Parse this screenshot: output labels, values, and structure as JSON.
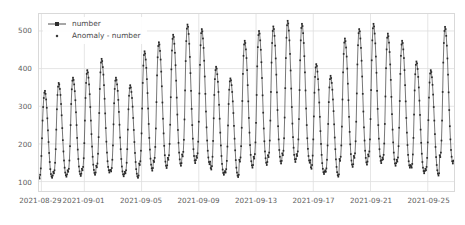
{
  "chart_data": {
    "type": "line",
    "title": "",
    "xlabel": "",
    "ylabel": "",
    "ylim": [
      75,
      545
    ],
    "xlim": [
      0,
      696
    ],
    "grid": true,
    "legend_position": "upper-left",
    "y_ticks": [
      100,
      200,
      300,
      400,
      500
    ],
    "y_tick_labels": [
      "100",
      "200",
      "300",
      "400",
      "500"
    ],
    "x_ticks": [
      4,
      76,
      172,
      268,
      364,
      460,
      556,
      652
    ],
    "x_tick_labels": [
      "2021-08-29",
      "2021-09-01",
      "2021-09-05",
      "2021-09-09",
      "2021-09-13",
      "2021-09-17",
      "2021-09-21",
      "2021-09-25"
    ],
    "series": [
      {
        "name": "number",
        "style": "line-markers",
        "color": "#3a3a3a",
        "marker": "square",
        "values": [
          112,
          108,
          118,
          135,
          168,
          215,
          262,
          298,
          322,
          336,
          341,
          333,
          318,
          296,
          268,
          236,
          205,
          176,
          152,
          133,
          120,
          114,
          110,
          116,
          126,
          122,
          130,
          150,
          186,
          238,
          292,
          330,
          352,
          362,
          358,
          346,
          330,
          306,
          276,
          242,
          210,
          180,
          156,
          137,
          124,
          117,
          113,
          119,
          130,
          126,
          134,
          156,
          194,
          250,
          306,
          345,
          368,
          376,
          370,
          358,
          340,
          316,
          284,
          250,
          216,
          185,
          160,
          140,
          127,
          120,
          115,
          121,
          134,
          130,
          139,
          162,
          202,
          262,
          322,
          362,
          386,
          396,
          390,
          376,
          358,
          332,
          298,
          262,
          226,
          193,
          166,
          145,
          131,
          123,
          118,
          124,
          142,
          138,
          148,
          174,
          218,
          282,
          346,
          390,
          416,
          426,
          420,
          404,
          384,
          356,
          320,
          281,
          242,
          206,
          177,
          154,
          139,
          130,
          124,
          130,
          131,
          127,
          136,
          158,
          196,
          252,
          308,
          346,
          368,
          376,
          370,
          358,
          341,
          317,
          285,
          251,
          217,
          186,
          160,
          140,
          127,
          119,
          114,
          120,
          126,
          122,
          130,
          150,
          186,
          238,
          292,
          328,
          348,
          356,
          350,
          338,
          322,
          299,
          269,
          237,
          205,
          176,
          152,
          133,
          121,
          114,
          110,
          116,
          148,
          144,
          154,
          182,
          228,
          294,
          362,
          408,
          436,
          446,
          440,
          424,
          402,
          372,
          335,
          294,
          253,
          216,
          185,
          161,
          145,
          135,
          129,
          136,
          156,
          152,
          163,
          192,
          241,
          311,
          382,
          430,
          460,
          470,
          464,
          447,
          424,
          392,
          353,
          310,
          267,
          228,
          195,
          170,
          153,
          142,
          136,
          143,
          163,
          158,
          170,
          200,
          251,
          324,
          398,
          448,
          479,
          490,
          484,
          466,
          442,
          409,
          368,
          323,
          278,
          237,
          203,
          177,
          159,
          148,
          142,
          149,
          172,
          167,
          179,
          211,
          265,
          342,
          420,
          473,
          506,
          517,
          511,
          492,
          466,
          431,
          388,
          341,
          293,
          250,
          214,
          186,
          168,
          156,
          149,
          157,
          168,
          163,
          175,
          206,
          259,
          334,
          410,
          462,
          494,
          505,
          499,
          480,
          455,
          421,
          379,
          333,
          286,
          244,
          209,
          182,
          164,
          152,
          146,
          153,
          136,
          132,
          141,
          166,
          208,
          268,
          330,
          372,
          396,
          405,
          400,
          385,
          365,
          338,
          304,
          267,
          230,
          196,
          168,
          147,
          132,
          123,
          118,
          124,
          128,
          124,
          133,
          155,
          193,
          249,
          306,
          344,
          366,
          374,
          369,
          356,
          338,
          313,
          282,
          248,
          214,
          183,
          157,
          137,
          124,
          116,
          112,
          118,
          158,
          153,
          164,
          194,
          243,
          314,
          386,
          434,
          464,
          474,
          468,
          451,
          428,
          396,
          356,
          313,
          269,
          230,
          197,
          171,
          154,
          143,
          137,
          144,
          166,
          161,
          173,
          204,
          256,
          330,
          406,
          457,
          489,
          500,
          493,
          475,
          450,
          417,
          375,
          329,
          283,
          241,
          207,
          180,
          162,
          150,
          144,
          152,
          170,
          165,
          177,
          209,
          262,
          338,
          416,
          468,
          500,
          512,
          505,
          487,
          461,
          427,
          384,
          337,
          290,
          247,
          212,
          184,
          166,
          154,
          148,
          155,
          175,
          170,
          182,
          215,
          270,
          348,
          428,
          482,
          515,
          527,
          520,
          501,
          475,
          439,
          395,
          347,
          298,
          254,
          218,
          190,
          171,
          159,
          152,
          160,
          173,
          168,
          180,
          212,
          266,
          343,
          422,
          475,
          508,
          519,
          513,
          494,
          468,
          433,
          390,
          342,
          294,
          250,
          215,
          187,
          168,
          156,
          150,
          157,
          138,
          134,
          144,
          169,
          212,
          273,
          336,
          378,
          403,
          412,
          407,
          392,
          372,
          344,
          310,
          272,
          234,
          200,
          171,
          149,
          134,
          125,
          120,
          126,
          130,
          126,
          135,
          158,
          196,
          253,
          311,
          350,
          372,
          381,
          375,
          362,
          344,
          318,
          287,
          252,
          217,
          186,
          159,
          139,
          125,
          117,
          113,
          119,
          160,
          155,
          166,
          196,
          246,
          318,
          390,
          439,
          469,
          480,
          473,
          456,
          432,
          400,
          360,
          316,
          272,
          232,
          199,
          173,
          156,
          145,
          139,
          146,
          168,
          163,
          175,
          207,
          259,
          334,
          411,
          462,
          494,
          505,
          499,
          480,
          455,
          421,
          379,
          333,
          286,
          244,
          209,
          182,
          163,
          151,
          145,
          153,
          172,
          167,
          180,
          212,
          266,
          343,
          422,
          475,
          507,
          519,
          512,
          493,
          467,
          432,
          389,
          341,
          293,
          250,
          214,
          186,
          167,
          155,
          149,
          157,
          164,
          159,
          171,
          201,
          253,
          326,
          401,
          451,
          482,
          493,
          486,
          469,
          444,
          411,
          370,
          325,
          279,
          238,
          204,
          177,
          159,
          148,
          142,
          149,
          158,
          153,
          164,
          194,
          243,
          314,
          386,
          434,
          464,
          474,
          468,
          451,
          428,
          396,
          356,
          313,
          269,
          230,
          197,
          171,
          154,
          143,
          137,
          144,
          141,
          137,
          147,
          172,
          216,
          278,
          342,
          385,
          410,
          419,
          414,
          399,
          378,
          350,
          315,
          277,
          238,
          203,
          174,
          152,
          137,
          128,
          122,
          128,
          134,
          130,
          139,
          163,
          204,
          263,
          323,
          363,
          387,
          396,
          391,
          377,
          357,
          331,
          298,
          262,
          226,
          192,
          165,
          144,
          130,
          121,
          116,
          122,
          170,
          165,
          177,
          209,
          262,
          338,
          416,
          468,
          500,
          511,
          505,
          487,
          461,
          427,
          384,
          337,
          290,
          247,
          212,
          184,
          166,
          154,
          148,
          155,
          156,
          152,
          163,
          192,
          241,
          311,
          382,
          430,
          459,
          470,
          464,
          447,
          423,
          392,
          353,
          310,
          267,
          228,
          195,
          170,
          152,
          142,
          136,
          143,
          140,
          136,
          146,
          171,
          214,
          276,
          339,
          382,
          406,
          415,
          410,
          395,
          375,
          347,
          313,
          275,
          236,
          202,
          173,
          151,
          136,
          127,
          121,
          128,
          126,
          122,
          131,
          152,
          190,
          244,
          299,
          336,
          357,
          365,
          360,
          347,
          330,
          306,
          276,
          243,
          209,
          179,
          154,
          135,
          122,
          114,
          110
        ]
      },
      {
        "name": "Anomaly - number",
        "style": "points",
        "color": "#3a3a3a",
        "marker": "dot",
        "values": []
      }
    ]
  },
  "legend": {
    "entries": [
      {
        "label": "number",
        "marker": "line-with-square"
      },
      {
        "label": "Anomaly - number",
        "marker": "dot"
      }
    ]
  }
}
